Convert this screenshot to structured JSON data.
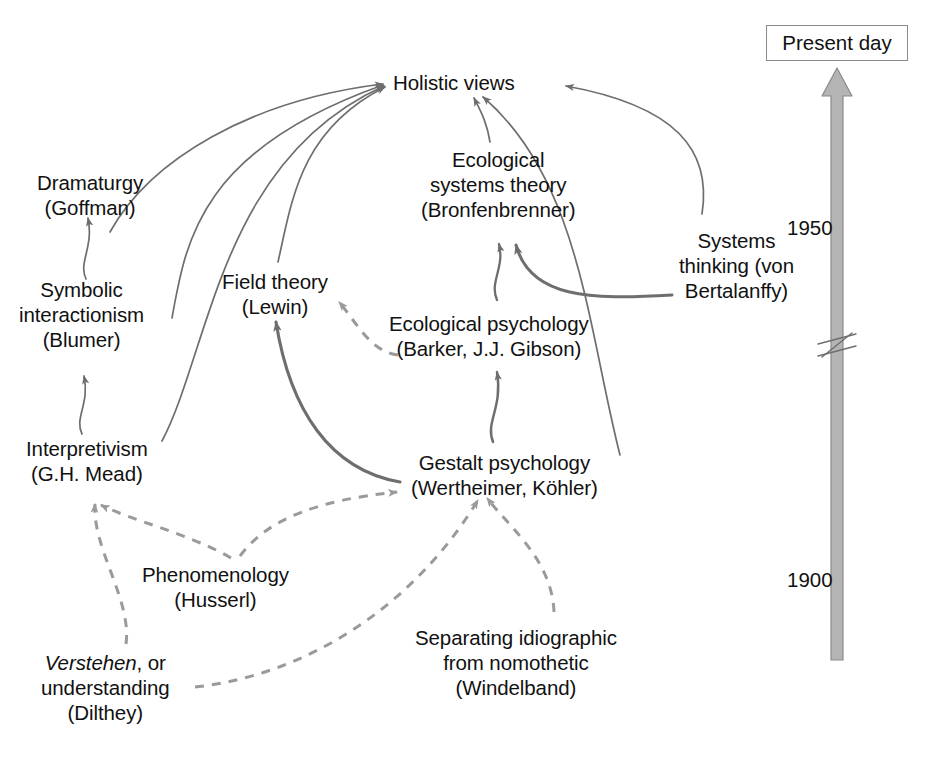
{
  "diagram": {
    "title_visible": false,
    "colors": {
      "text": "#111111",
      "solid_edge": "#6e6e6e",
      "dashed_edge": "#9a9a9a",
      "timeline_fill": "#b4b4b4",
      "timeline_stroke": "#8a8a8a",
      "box_border": "#8a8a8a",
      "background": "#ffffff"
    },
    "nodes": [
      {
        "id": "holistic-views",
        "lines": [
          "Holistic views"
        ],
        "x": 393,
        "y": 70
      },
      {
        "id": "dramaturgy-goffman",
        "lines": [
          "Dramaturgy",
          "(Goffman)"
        ],
        "x": 37,
        "y": 170
      },
      {
        "id": "ecological-systems-theory",
        "lines": [
          "Ecological",
          "systems theory",
          "(Bronfenbrenner)"
        ],
        "x": 421,
        "y": 147
      },
      {
        "id": "systems-thinking",
        "lines": [
          "Systems",
          "thinking (von",
          "Bertalanffy)"
        ],
        "x": 679,
        "y": 228
      },
      {
        "id": "field-theory-lewin",
        "lines": [
          "Field theory",
          "(Lewin)"
        ],
        "x": 222,
        "y": 269
      },
      {
        "id": "symbolic-interactionism-blumer",
        "lines": [
          "Symbolic",
          "interactionism",
          "(Blumer)"
        ],
        "x": 19,
        "y": 277
      },
      {
        "id": "ecological-psychology",
        "lines": [
          "Ecological psychology",
          "(Barker, J.J. Gibson)"
        ],
        "x": 389,
        "y": 311
      },
      {
        "id": "interpretivism-mead",
        "lines": [
          "Interpretivism",
          "(G.H. Mead)"
        ],
        "x": 26,
        "y": 436
      },
      {
        "id": "gestalt-psychology",
        "lines": [
          "Gestalt psychology",
          "(Wertheimer, Köhler)"
        ],
        "x": 411,
        "y": 450
      },
      {
        "id": "phenomenology-husserl",
        "lines": [
          "Phenomenology",
          "(Husserl)"
        ],
        "x": 142,
        "y": 562
      },
      {
        "id": "separating-idiographic",
        "lines": [
          "Separating idiographic",
          "from nomothetic",
          "(Windelband)"
        ],
        "x": 415,
        "y": 625
      },
      {
        "id": "verstehen-dilthey",
        "lines": [
          "Verstehen, or",
          "understanding",
          "(Dilthey)"
        ],
        "x": 41,
        "y": 650,
        "italic_first_word": "Verstehen"
      }
    ],
    "edges": [
      {
        "from": "dramaturgy-goffman",
        "to": "holistic-views",
        "style": "solid"
      },
      {
        "from": "symbolic-interactionism-blumer",
        "to": "holistic-views",
        "style": "solid"
      },
      {
        "from": "interpretivism-mead",
        "to": "holistic-views",
        "style": "solid"
      },
      {
        "from": "field-theory-lewin",
        "to": "holistic-views",
        "style": "solid"
      },
      {
        "from": "symbolic-interactionism-blumer",
        "to": "dramaturgy-goffman",
        "style": "solid"
      },
      {
        "from": "interpretivism-mead",
        "to": "symbolic-interactionism-blumer",
        "style": "solid"
      },
      {
        "from": "gestalt-psychology",
        "to": "field-theory-lewin",
        "style": "solid"
      },
      {
        "from": "ecological-psychology",
        "to": "field-theory-lewin",
        "style": "dashed"
      },
      {
        "from": "gestalt-psychology",
        "to": "ecological-psychology",
        "style": "solid"
      },
      {
        "from": "ecological-psychology",
        "to": "ecological-systems-theory",
        "style": "solid"
      },
      {
        "from": "systems-thinking",
        "to": "ecological-systems-theory",
        "style": "solid"
      },
      {
        "from": "ecological-systems-theory",
        "to": "holistic-views",
        "style": "solid"
      },
      {
        "from": "gestalt-psychology",
        "to": "holistic-views",
        "style": "solid"
      },
      {
        "from": "systems-thinking",
        "to": "holistic-views",
        "style": "solid"
      },
      {
        "from": "phenomenology-husserl",
        "to": "interpretivism-mead",
        "style": "dashed"
      },
      {
        "from": "phenomenology-husserl",
        "to": "gestalt-psychology",
        "style": "dashed"
      },
      {
        "from": "verstehen-dilthey",
        "to": "interpretivism-mead",
        "style": "dashed"
      },
      {
        "from": "verstehen-dilthey",
        "to": "gestalt-psychology",
        "style": "dashed"
      },
      {
        "from": "separating-idiographic",
        "to": "gestalt-psychology",
        "style": "dashed"
      }
    ]
  },
  "timeline": {
    "present_day_label": "Present day",
    "ticks": [
      {
        "label": "1950",
        "x": 850,
        "y": 228
      },
      {
        "label": "1900",
        "x": 850,
        "y": 580
      }
    ],
    "has_break_symbol": true,
    "direction": "upward"
  }
}
